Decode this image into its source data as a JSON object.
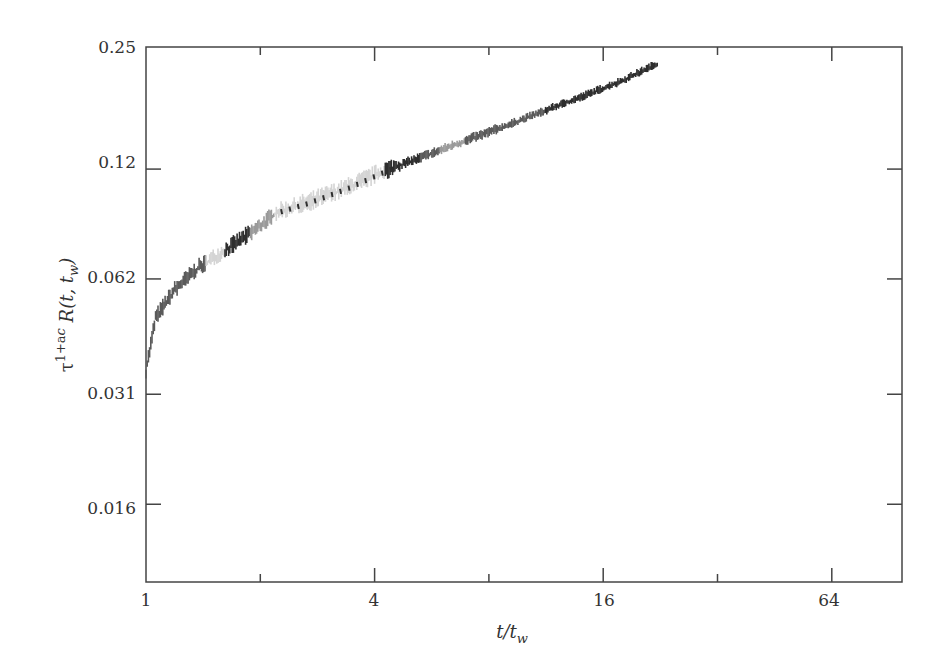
{
  "chart_data": {
    "type": "line",
    "title": "",
    "xlabel": "t/t_w",
    "ylabel": "τ^{1+a_c} R(t, t_w)",
    "xscale": "log2",
    "yscale": "log2",
    "xlim": [
      1,
      101
    ],
    "ylim": [
      0.0103,
      0.25
    ],
    "x_ticks": [
      "1",
      "4",
      "16",
      "64"
    ],
    "x_minor_ticks": [
      2,
      8,
      32
    ],
    "y_ticks": [
      "0.25",
      "0.12",
      "0.062",
      "0.031",
      "0.016"
    ],
    "grid": false,
    "legend": null,
    "series": [
      {
        "name": "collapsed response (overlapping grey traces)",
        "x": [
          1.0,
          1.06,
          1.19,
          1.37,
          1.65,
          1.97,
          2.22,
          2.66,
          3.39,
          4.3,
          5.46,
          6.94,
          8.8,
          11.2,
          14.2,
          18.0,
          22.2
        ],
        "y": [
          0.0357,
          0.0489,
          0.0579,
          0.066,
          0.0745,
          0.0841,
          0.0926,
          0.0978,
          0.107,
          0.119,
          0.13,
          0.142,
          0.155,
          0.17,
          0.186,
          0.204,
          0.226
        ]
      }
    ],
    "series_colors": [
      "#2e2e2e",
      "#5a5a5a",
      "#9a9a9a",
      "#d4d4d4"
    ]
  },
  "axes": {
    "x_label_main": "t/t",
    "x_label_sub": "w",
    "y_label_tau": "τ",
    "y_label_exp": "1+a",
    "y_label_exp_sub": "c",
    "y_label_rest": " R(t, t",
    "y_label_sub": "w",
    "y_label_close": ")"
  }
}
